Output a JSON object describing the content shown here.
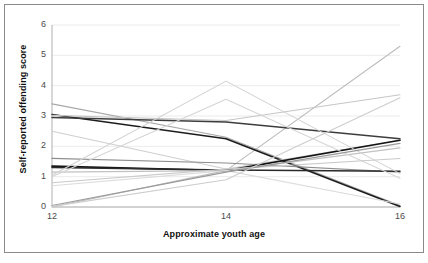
{
  "figure": {
    "width": 428,
    "height": 263,
    "background": "#ffffff",
    "border_color": "#8a8a8a",
    "title": ""
  },
  "axes": {
    "y_title": "Self-reported offending score",
    "x_title": "Approximate youth age",
    "y_ticks": [
      "0",
      "1",
      "2",
      "3",
      "4",
      "5",
      "6"
    ],
    "x_ticks": [
      "12",
      "14",
      "16"
    ],
    "gridline_color": "#e6e6e6",
    "axis_color": "#b0b0b0",
    "tick_text_color": "#4a4a4a"
  },
  "plot_geometry": {
    "left": 52,
    "right": 400,
    "top": 25,
    "bottom": 207
  },
  "chart_data": {
    "type": "line",
    "title": "",
    "xlabel": "Approximate youth age",
    "ylabel": "Self-reported offending score",
    "x": [
      12,
      14,
      16
    ],
    "xlim": [
      12,
      16
    ],
    "ylim": [
      0,
      6
    ],
    "grid": true,
    "legend": "none",
    "annotation": "Spaghetti plot of individual youth offending trajectories across three measurement ages",
    "series": [
      {
        "name": "youth-01",
        "values": [
          0.0,
          1.2,
          5.3
        ],
        "color": "#bcbcbc",
        "width": 1.1
      },
      {
        "name": "youth-02",
        "values": [
          3.4,
          2.3,
          0.05
        ],
        "color": "#a8a8a8",
        "width": 1.1
      },
      {
        "name": "youth-03",
        "values": [
          3.05,
          2.25,
          0.02
        ],
        "color": "#1c1c1c",
        "width": 1.6
      },
      {
        "name": "youth-04",
        "values": [
          3.02,
          2.85,
          3.7
        ],
        "color": "#c6c6c6",
        "width": 1.1
      },
      {
        "name": "youth-05",
        "values": [
          2.95,
          2.8,
          2.25
        ],
        "color": "#3d3d3d",
        "width": 1.5
      },
      {
        "name": "youth-06",
        "values": [
          2.5,
          1.25,
          2.2
        ],
        "color": "#cfcfcf",
        "width": 1.1
      },
      {
        "name": "youth-07",
        "values": [
          1.6,
          1.45,
          1.15
        ],
        "color": "#8e8e8e",
        "width": 1.2
      },
      {
        "name": "youth-08",
        "values": [
          1.35,
          1.2,
          2.2
        ],
        "color": "#141414",
        "width": 1.7
      },
      {
        "name": "youth-09",
        "values": [
          1.3,
          1.22,
          1.18
        ],
        "color": "#2a2a2a",
        "width": 1.5
      },
      {
        "name": "youth-10",
        "values": [
          1.15,
          1.2,
          1.95
        ],
        "color": "#c2c2c2",
        "width": 1.1
      },
      {
        "name": "youth-11",
        "values": [
          1.05,
          4.15,
          1.1
        ],
        "color": "#d2d2d2",
        "width": 1.1
      },
      {
        "name": "youth-12",
        "values": [
          1.0,
          3.55,
          0.95
        ],
        "color": "#d6d6d6",
        "width": 1.1
      },
      {
        "name": "youth-13",
        "values": [
          0.8,
          1.25,
          1.6
        ],
        "color": "#cacaca",
        "width": 1.1
      },
      {
        "name": "youth-14",
        "values": [
          0.7,
          1.2,
          0.1
        ],
        "color": "#dcdcdc",
        "width": 1.1
      },
      {
        "name": "youth-15",
        "values": [
          0.05,
          1.15,
          2.1
        ],
        "color": "#9a9a9a",
        "width": 1.2
      },
      {
        "name": "youth-16",
        "values": [
          0.02,
          0.9,
          3.6
        ],
        "color": "#cdcdcd",
        "width": 1.1
      }
    ]
  }
}
